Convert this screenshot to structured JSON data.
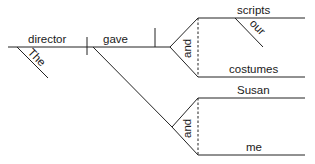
{
  "diagram": {
    "type": "Reed-Kellogg sentence diagram",
    "words": {
      "subject": "director",
      "subject_modifier": "The",
      "verb": "gave",
      "conjunction_direct_objects": "and",
      "direct_object_1": "scripts",
      "direct_object_1_modifier": "our",
      "direct_object_2": "costumes",
      "conjunction_indirect_objects": "and",
      "indirect_object_1": "Susan",
      "indirect_object_2": "me"
    }
  }
}
